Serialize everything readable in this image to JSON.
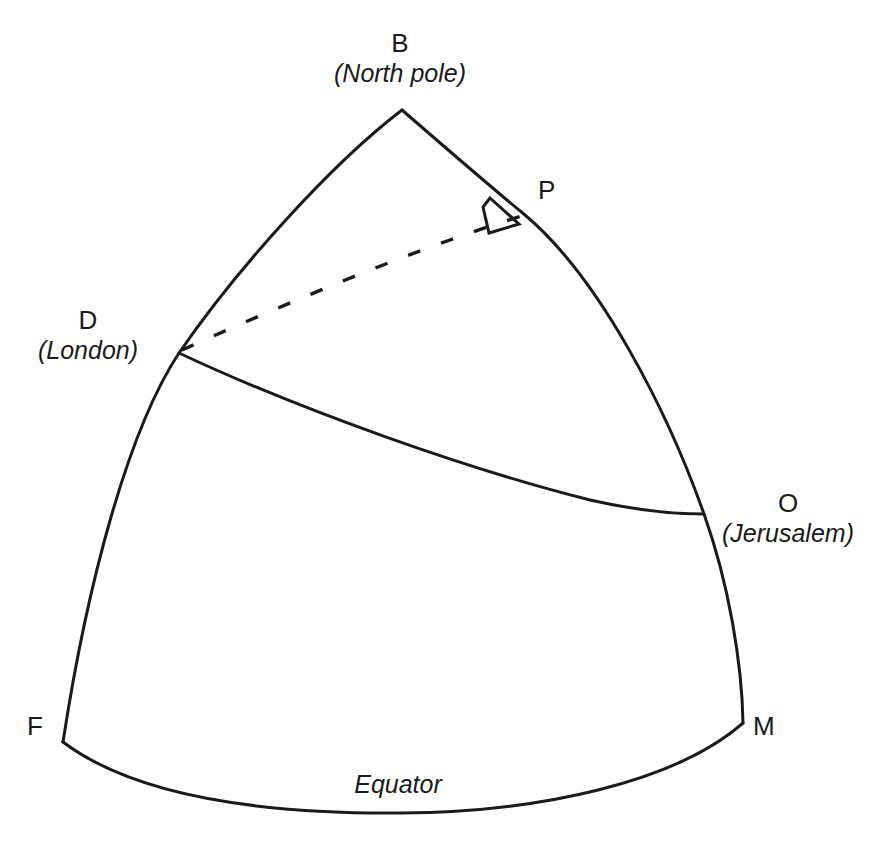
{
  "figure": {
    "background_color": "#ffffff",
    "line_color": "#1a1a1a",
    "vertices": [
      {
        "id": "B",
        "point_label": "B",
        "place_label": "(North pole)",
        "x": 402,
        "y": 110,
        "label_x": 400,
        "label_y": 28,
        "label_align": "center"
      },
      {
        "id": "D",
        "point_label": "D",
        "place_label": "(London)",
        "x": 179,
        "y": 353,
        "label_x": 24,
        "label_y": 305,
        "label_align": "center"
      },
      {
        "id": "O",
        "point_label": "O",
        "place_label": "(Jerusalem)",
        "x": 704,
        "y": 514,
        "label_x": 722,
        "label_y": 488,
        "label_align": "left"
      },
      {
        "id": "P",
        "point_label": "P",
        "place_label": "",
        "x": 525,
        "y": 215,
        "label_x": 538,
        "label_y": 175,
        "label_align": "left"
      },
      {
        "id": "F",
        "point_label": "F",
        "place_label": "",
        "x": 63,
        "y": 742,
        "label_x": 24,
        "label_y": 708,
        "label_align": "left"
      },
      {
        "id": "M",
        "point_label": "M",
        "place_label": "",
        "x": 743,
        "y": 723,
        "label_x": 753,
        "label_y": 708,
        "label_align": "left"
      }
    ],
    "equator": {
      "label": "Equator",
      "label_x": 398,
      "label_y": 770
    },
    "edges": [
      {
        "id": "meridian-B-D-F",
        "from": "B",
        "to": "F",
        "style": "solid",
        "label": ""
      },
      {
        "id": "meridian-B-P-O-M",
        "from": "B",
        "to": "M",
        "style": "solid",
        "label": ""
      },
      {
        "id": "equator-F-M",
        "from": "F",
        "to": "M",
        "style": "solid",
        "label": ""
      },
      {
        "id": "great-circle-D-O",
        "from": "D",
        "to": "O",
        "style": "solid",
        "label": ""
      },
      {
        "id": "perpendicular-D-P",
        "from": "D",
        "to": "P",
        "style": "dashed",
        "label": ""
      }
    ],
    "markers": [
      {
        "id": "right-angle-at-P",
        "type": "right-angle",
        "at": "P"
      }
    ]
  }
}
